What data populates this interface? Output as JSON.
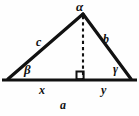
{
  "figure": {
    "type": "geometry-diagram",
    "background_color": "#fefefe",
    "stroke_color": "#111111"
  },
  "angles": {
    "apex": "α",
    "bottom_left": "β",
    "bottom_right": "γ"
  },
  "sides": {
    "left_leg": "c",
    "right_leg": "b",
    "base": "a",
    "base_left_segment": "x",
    "base_right_segment": "y"
  },
  "geometry": {
    "apex": [
      83,
      14
    ],
    "bottom_left": [
      8,
      80
    ],
    "bottom_right": [
      131,
      80
    ],
    "altitude_foot": [
      83,
      80
    ],
    "base_line": [
      [
        2,
        80
      ],
      [
        137,
        80
      ]
    ],
    "right_angle_marker": true,
    "altitude_style": "dashed"
  }
}
